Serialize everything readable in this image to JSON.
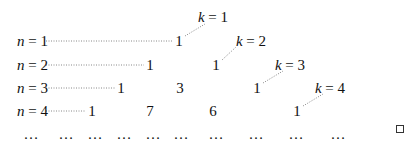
{
  "columns": {
    "k1": {
      "var": "k",
      "eq": " = ",
      "val": "1"
    },
    "k2": {
      "var": "k",
      "eq": " = ",
      "val": "2"
    },
    "k3": {
      "var": "k",
      "eq": " = ",
      "val": "3"
    },
    "k4": {
      "var": "k",
      "eq": " = ",
      "val": "4"
    }
  },
  "rows": [
    {
      "var": "n",
      "eq": " = ",
      "val": "1",
      "entries": [
        "1"
      ]
    },
    {
      "var": "n",
      "eq": " = ",
      "val": "2",
      "entries": [
        "1",
        "1"
      ]
    },
    {
      "var": "n",
      "eq": " = ",
      "val": "3",
      "entries": [
        "1",
        "3",
        "1"
      ]
    },
    {
      "var": "n",
      "eq": " = ",
      "val": "4",
      "entries": [
        "1",
        "7",
        "6",
        "1"
      ]
    }
  ],
  "ellipsis": [
    "…",
    "…",
    "…",
    "…",
    "…",
    "…",
    "…",
    "…",
    "…",
    "…"
  ],
  "end_of_proof": "□"
}
